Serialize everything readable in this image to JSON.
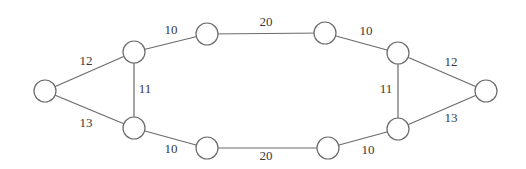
{
  "diagram": {
    "type": "weighted-undirected-graph",
    "nodes": [
      {
        "id": "n1",
        "x": 45,
        "y": 91,
        "r": 11
      },
      {
        "id": "n2",
        "x": 134,
        "y": 52,
        "r": 11
      },
      {
        "id": "n3",
        "x": 134,
        "y": 128,
        "r": 11
      },
      {
        "id": "n4",
        "x": 207,
        "y": 34,
        "r": 11
      },
      {
        "id": "n5",
        "x": 207,
        "y": 148,
        "r": 11
      },
      {
        "id": "n6",
        "x": 325,
        "y": 33,
        "r": 11
      },
      {
        "id": "n7",
        "x": 328,
        "y": 148,
        "r": 11
      },
      {
        "id": "n8",
        "x": 398,
        "y": 53,
        "r": 11
      },
      {
        "id": "n9",
        "x": 398,
        "y": 129,
        "r": 11
      },
      {
        "id": "n10",
        "x": 486,
        "y": 91,
        "r": 11
      }
    ],
    "edges": [
      {
        "from": "n1",
        "to": "n2",
        "weight": "12",
        "lx": 86,
        "ly": 62
      },
      {
        "from": "n1",
        "to": "n3",
        "weight": "13",
        "lx": 86,
        "ly": 124
      },
      {
        "from": "n2",
        "to": "n3",
        "weight": "11",
        "lx": 145,
        "ly": 90
      },
      {
        "from": "n2",
        "to": "n4",
        "weight": "10",
        "lx": 171,
        "ly": 31
      },
      {
        "from": "n3",
        "to": "n5",
        "weight": "10",
        "lx": 171,
        "ly": 150
      },
      {
        "from": "n4",
        "to": "n6",
        "weight": "20",
        "lx": 266,
        "ly": 23
      },
      {
        "from": "n5",
        "to": "n7",
        "weight": "20",
        "lx": 266,
        "ly": 157
      },
      {
        "from": "n6",
        "to": "n8",
        "weight": "10",
        "lx": 366,
        "ly": 32
      },
      {
        "from": "n7",
        "to": "n9",
        "weight": "10",
        "lx": 368,
        "ly": 151
      },
      {
        "from": "n8",
        "to": "n9",
        "weight": "11",
        "lx": 386,
        "ly": 90
      },
      {
        "from": "n8",
        "to": "n10",
        "weight": "12",
        "lx": 451,
        "ly": 63
      },
      {
        "from": "n9",
        "to": "n10",
        "weight": "13",
        "lx": 451,
        "ly": 119
      }
    ]
  }
}
